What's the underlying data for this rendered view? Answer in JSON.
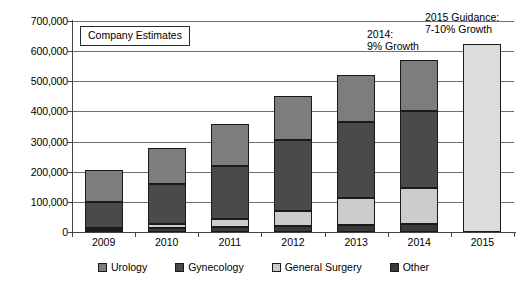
{
  "annotations": {
    "company_estimates": "Company Estimates",
    "growth_2014_line1": "2014:",
    "growth_2014_line2": "9% Growth",
    "guidance_2015_line1": "2015 Guidance:",
    "guidance_2015_line2": "7-10% Growth"
  },
  "colors": {
    "urology": "#7d7d7d",
    "gynecology": "#4a4a4a",
    "general_surgery": "#cccccc",
    "other": "#3a3a3a",
    "guidance": "#dcdcdc",
    "gridline": "#6e6e6e",
    "outline": "#1a1a1a"
  },
  "chart_data": {
    "type": "bar",
    "stacked": true,
    "title": "",
    "xlabel": "",
    "ylabel": "",
    "ylim": [
      0,
      700000
    ],
    "yticks": [
      "0",
      "100,000",
      "200,000",
      "300,000",
      "400,000",
      "500,000",
      "600,000",
      "700,000"
    ],
    "ytick_values": [
      0,
      100000,
      200000,
      300000,
      400000,
      500000,
      600000,
      700000
    ],
    "grid": true,
    "legend_position": "bottom",
    "categories": [
      "2009",
      "2010",
      "2011",
      "2012",
      "2013",
      "2014",
      "2015"
    ],
    "series": [
      {
        "name": "Other",
        "values": [
          8000,
          12000,
          18000,
          20000,
          22000,
          25000,
          0
        ]
      },
      {
        "name": "General Surgery",
        "values": [
          6000,
          16000,
          24000,
          50000,
          92000,
          122000,
          0
        ]
      },
      {
        "name": "Gynecology",
        "values": [
          86000,
          132000,
          178000,
          235000,
          252000,
          253000,
          0
        ]
      },
      {
        "name": "Urology",
        "values": [
          105000,
          118000,
          140000,
          145000,
          156000,
          170000,
          0
        ]
      },
      {
        "name": "Guidance",
        "values": [
          0,
          0,
          0,
          0,
          0,
          0,
          625000
        ]
      }
    ],
    "totals": [
      205000,
      278000,
      360000,
      450000,
      522000,
      570000,
      625000
    ]
  },
  "legend": {
    "items": [
      {
        "label": "Urology",
        "color_key": "urology"
      },
      {
        "label": "Gynecology",
        "color_key": "gynecology"
      },
      {
        "label": "General Surgery",
        "color_key": "general_surgery"
      },
      {
        "label": "Other",
        "color_key": "other"
      }
    ]
  }
}
